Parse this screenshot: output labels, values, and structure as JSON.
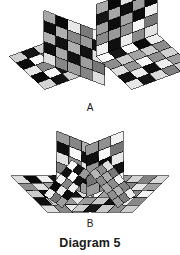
{
  "page": {
    "background_color": "#ffffff",
    "width": 180,
    "height": 255
  },
  "caption": {
    "text": "Diagram 5"
  },
  "figures": [
    {
      "id": "figure-a",
      "label": "A",
      "description": "Two tiled polyhedral pieces: a detached flat grid floor with a separate standing grid wall, and a joined L-shaped grid corner.",
      "label_position": {
        "x": 88,
        "y": 108
      }
    },
    {
      "id": "figure-b",
      "label": "B",
      "description": "A symmetric boat-shaped tiled figure with two raised V walls meeting at the center and two flat wings spreading outward.",
      "label_position": {
        "x": 88,
        "y": 224
      }
    }
  ],
  "chart_data": {
    "type": "diagram",
    "title": "Diagram 5",
    "style": {
      "tile_stroke": "#000000",
      "tile_stroke_width": 0.55,
      "shade_light": "#f2f2f2",
      "shade_mid": "#8f8f8f",
      "shade_dark": "#1c1c1c",
      "shade_black": "#0a0a0a"
    },
    "shapes": [
      {
        "name": "figure-a-left-floor",
        "kind": "grid-parallelogram",
        "origin": {
          "x": 10,
          "y": 55
        },
        "u": {
          "x": 12.4,
          "y": -4.9
        },
        "v": {
          "x": 8.6,
          "y": 6.4
        },
        "cols": 5,
        "rows": 5,
        "shading": "floor"
      },
      {
        "name": "figure-a-left-wall",
        "kind": "grid-parallelogram",
        "origin": {
          "x": 44,
          "y": 10
        },
        "u": {
          "x": 12.4,
          "y": 4.9
        },
        "v": {
          "x": 0,
          "y": 10.2
        },
        "cols": 5,
        "rows": 5,
        "shading": "wall"
      },
      {
        "name": "figure-b-left-wing",
        "kind": "grid-parallelogram",
        "origin": {
          "x": 12,
          "y": 175
        },
        "u": {
          "x": 12.4,
          "y": -0.2
        },
        "v": {
          "x": 8.6,
          "y": 7.2
        },
        "cols": 5,
        "rows": 5,
        "shading": "floor"
      }
    ]
  }
}
